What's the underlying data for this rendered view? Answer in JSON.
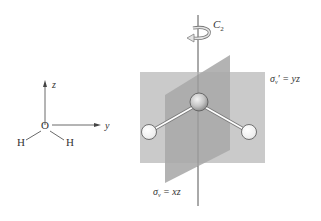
{
  "axes_diagram": {
    "z_label": "z",
    "y_label": "y",
    "oxygen": "O",
    "hydrogen_left": "H",
    "hydrogen_right": "H"
  },
  "symmetry_diagram": {
    "c2_label": "C",
    "c2_subscript": "2",
    "sigma_v_prime": {
      "symbol": "σ",
      "subscript": "v",
      "prime": "'",
      "equals": " = yz"
    },
    "sigma_v": {
      "symbol": "σ",
      "subscript": "v",
      "equals": " = xz"
    }
  },
  "colors": {
    "back_plane": "#c9c9c9",
    "front_plane": "#a9a9a9",
    "axis_line": "#555555",
    "atom_fill": "#f2f2f2",
    "atom_stroke": "#666666",
    "oxygen_fill": "#bcbcbc",
    "bond": "#ffffff"
  }
}
